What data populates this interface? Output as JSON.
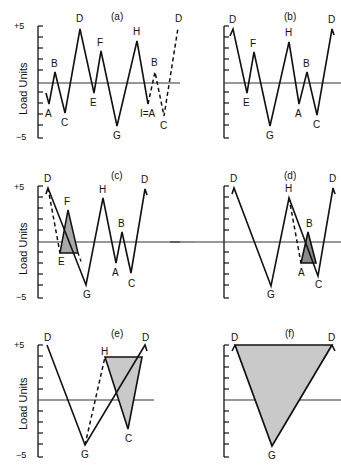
{
  "figure": {
    "y_axis_label": "Load Units",
    "y_tick_top": "+5",
    "y_tick_bottom": "−5",
    "fill_light": "#c9c9c9",
    "fill_dark": "#8a8a8a",
    "line_color": "#111111"
  },
  "panels": [
    {
      "id": "a",
      "title": "(a)",
      "description": "Original load history with dashed repeat I=A, B, C, D",
      "points": [
        {
          "label": "A",
          "value": -2
        },
        {
          "label": "B",
          "value": 1
        },
        {
          "label": "C",
          "value": -3
        },
        {
          "label": "D",
          "value": 5
        },
        {
          "label": "E",
          "value": -1
        },
        {
          "label": "F",
          "value": 3
        },
        {
          "label": "G",
          "value": -4
        },
        {
          "label": "H",
          "value": 4
        },
        {
          "label": "I=A",
          "value": -2
        },
        {
          "label": "B",
          "value": 1,
          "dashed": true
        },
        {
          "label": "C",
          "value": -3,
          "dashed": true
        },
        {
          "label": "D",
          "value": 5,
          "dashed": true
        }
      ]
    },
    {
      "id": "b",
      "title": "(b)",
      "description": "History rearranged to start and end at peak D",
      "points": [
        {
          "label": "D",
          "value": 5
        },
        {
          "label": "E",
          "value": -1
        },
        {
          "label": "F",
          "value": 3
        },
        {
          "label": "G",
          "value": -4
        },
        {
          "label": "H",
          "value": 4
        },
        {
          "label": "A",
          "value": -2
        },
        {
          "label": "B",
          "value": 1
        },
        {
          "label": "C",
          "value": -3
        },
        {
          "label": "D",
          "value": 5
        }
      ]
    },
    {
      "id": "c",
      "title": "(c)",
      "description": "Cycle E-F extracted (shaded)",
      "points": [
        {
          "label": "D",
          "value": 5
        },
        {
          "label": "E",
          "value": -1
        },
        {
          "label": "F",
          "value": 3
        },
        {
          "label": "G",
          "value": -4
        },
        {
          "label": "H",
          "value": 4
        },
        {
          "label": "A",
          "value": -2
        },
        {
          "label": "B",
          "value": 1
        },
        {
          "label": "C",
          "value": -3
        },
        {
          "label": "D",
          "value": 5
        }
      ]
    },
    {
      "id": "d",
      "title": "(d)",
      "description": "Cycle A-B extracted (shaded)",
      "points": [
        {
          "label": "D",
          "value": 5
        },
        {
          "label": "G",
          "value": -4
        },
        {
          "label": "H",
          "value": 4
        },
        {
          "label": "A",
          "value": -2
        },
        {
          "label": "B",
          "value": 1
        },
        {
          "label": "C",
          "value": -3
        },
        {
          "label": "D",
          "value": 5
        }
      ]
    },
    {
      "id": "e",
      "title": "(e)",
      "description": "Cycle H-C extracted (shaded)",
      "points": [
        {
          "label": "D",
          "value": 5
        },
        {
          "label": "G",
          "value": -4
        },
        {
          "label": "H",
          "value": 4
        },
        {
          "label": "C",
          "value": -3
        },
        {
          "label": "D",
          "value": 5
        }
      ]
    },
    {
      "id": "f",
      "title": "(f)",
      "description": "Final cycle D-G-D (shaded)",
      "points": [
        {
          "label": "D",
          "value": 5
        },
        {
          "label": "G",
          "value": -4
        },
        {
          "label": "D",
          "value": 5
        }
      ]
    }
  ],
  "labels": {
    "a": [
      "A",
      "B",
      "C",
      "D",
      "E",
      "F",
      "G",
      "H",
      "I=A",
      "B",
      "C",
      "D"
    ],
    "b": [
      "D",
      "E",
      "F",
      "G",
      "H",
      "A",
      "B",
      "C",
      "D"
    ],
    "c": [
      "D",
      "E",
      "F",
      "G",
      "H",
      "A",
      "B",
      "C",
      "D"
    ],
    "d": [
      "D",
      "G",
      "H",
      "A",
      "B",
      "C",
      "D"
    ],
    "e": [
      "D",
      "H",
      "G",
      "C",
      "D"
    ],
    "f": [
      "D",
      "D",
      "G"
    ]
  },
  "titles": {
    "a": "(a)",
    "b": "(b)",
    "c": "(c)",
    "d": "(d)",
    "e": "(e)",
    "f": "(f)"
  }
}
